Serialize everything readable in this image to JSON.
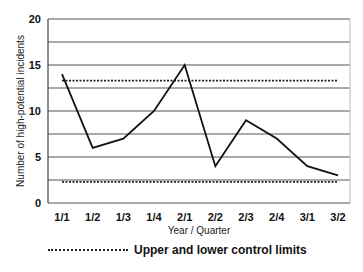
{
  "chart_data": {
    "type": "line",
    "title": "",
    "xlabel": "Year / Quarter",
    "ylabel": "Number of high-potential incidents",
    "ylim": [
      0,
      20
    ],
    "yticks": [
      0,
      5,
      10,
      15,
      20
    ],
    "grid": true,
    "categories": [
      "1/1",
      "1/2",
      "1/3",
      "1/4",
      "2/1",
      "2/2",
      "2/3",
      "2/4",
      "3/1",
      "3/2"
    ],
    "series": [
      {
        "name": "High-potential incidents",
        "values": [
          14,
          6,
          7,
          10,
          15,
          4,
          9,
          7,
          4,
          3
        ],
        "style": "solid"
      },
      {
        "name": "Upper control limit",
        "values": [
          13.3,
          13.3,
          13.3,
          13.3,
          13.3,
          13.3,
          13.3,
          13.3,
          13.3,
          13.3
        ],
        "style": "dotted"
      },
      {
        "name": "Lower control limit",
        "values": [
          2.3,
          2.3,
          2.3,
          2.3,
          2.3,
          2.3,
          2.3,
          2.3,
          2.3,
          2.3
        ],
        "style": "dotted"
      }
    ],
    "legend": {
      "position": "bottom",
      "entries": [
        "Upper and lower control limits"
      ]
    }
  },
  "legend_label": "Upper and lower control limits"
}
